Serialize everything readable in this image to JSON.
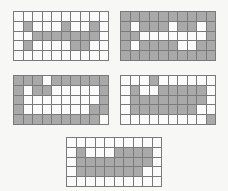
{
  "colors": {
    "background": "#f7f7f5",
    "filled_cell": "#a9a9a9",
    "empty_cell": "#fbfbfb",
    "grid_line": "#7a7a7a"
  },
  "grids": [
    {
      "id": "grid-top-left",
      "position": {
        "x": 13,
        "y": 11
      },
      "cols": 10,
      "rows": 5,
      "cells": [
        [
          0,
          0,
          0,
          0,
          0,
          0,
          0,
          0,
          0,
          0
        ],
        [
          0,
          1,
          0,
          0,
          0,
          1,
          0,
          0,
          1,
          0
        ],
        [
          0,
          0,
          1,
          1,
          1,
          1,
          1,
          1,
          1,
          0
        ],
        [
          0,
          1,
          0,
          0,
          0,
          0,
          1,
          1,
          0,
          0
        ],
        [
          0,
          0,
          0,
          0,
          0,
          0,
          0,
          0,
          0,
          0
        ]
      ]
    },
    {
      "id": "grid-top-right",
      "position": {
        "x": 120,
        "y": 11
      },
      "cols": 10,
      "rows": 5,
      "cells": [
        [
          1,
          1,
          1,
          1,
          1,
          1,
          1,
          1,
          1,
          1
        ],
        [
          1,
          0,
          1,
          1,
          1,
          0,
          1,
          1,
          0,
          1
        ],
        [
          1,
          1,
          0,
          0,
          0,
          0,
          0,
          0,
          0,
          1
        ],
        [
          1,
          0,
          1,
          1,
          1,
          1,
          0,
          0,
          1,
          1
        ],
        [
          1,
          1,
          1,
          1,
          1,
          1,
          1,
          1,
          1,
          1
        ]
      ]
    },
    {
      "id": "grid-middle-left",
      "position": {
        "x": 13,
        "y": 75
      },
      "cols": 10,
      "rows": 5,
      "cells": [
        [
          1,
          1,
          1,
          0,
          1,
          1,
          1,
          1,
          1,
          1
        ],
        [
          1,
          0,
          1,
          1,
          0,
          0,
          0,
          0,
          0,
          1
        ],
        [
          1,
          0,
          0,
          0,
          0,
          0,
          0,
          0,
          0,
          1
        ],
        [
          1,
          0,
          0,
          0,
          0,
          0,
          0,
          0,
          1,
          1
        ],
        [
          1,
          1,
          1,
          1,
          1,
          1,
          1,
          1,
          1,
          0
        ]
      ]
    },
    {
      "id": "grid-middle-right",
      "position": {
        "x": 120,
        "y": 75
      },
      "cols": 10,
      "rows": 5,
      "cells": [
        [
          0,
          0,
          0,
          1,
          0,
          0,
          0,
          0,
          0,
          0
        ],
        [
          0,
          1,
          0,
          0,
          1,
          1,
          1,
          1,
          1,
          0
        ],
        [
          0,
          1,
          1,
          1,
          1,
          1,
          1,
          1,
          1,
          0
        ],
        [
          0,
          1,
          1,
          1,
          1,
          1,
          1,
          1,
          0,
          0
        ],
        [
          0,
          0,
          0,
          0,
          0,
          0,
          0,
          0,
          0,
          1
        ]
      ]
    },
    {
      "id": "grid-bottom-center",
      "position": {
        "x": 66,
        "y": 137
      },
      "cols": 10,
      "rows": 5,
      "cells": [
        [
          0,
          0,
          0,
          0,
          0,
          0,
          0,
          0,
          0,
          0
        ],
        [
          0,
          1,
          0,
          0,
          0,
          1,
          1,
          1,
          1,
          0
        ],
        [
          0,
          1,
          1,
          1,
          1,
          1,
          1,
          1,
          1,
          0
        ],
        [
          0,
          1,
          1,
          1,
          1,
          1,
          1,
          1,
          0,
          0
        ],
        [
          0,
          0,
          0,
          0,
          0,
          0,
          0,
          0,
          0,
          0
        ]
      ]
    }
  ]
}
